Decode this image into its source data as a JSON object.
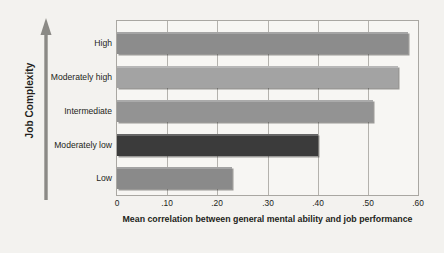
{
  "figure": {
    "background_color": "#f3f2ef",
    "plot_background_color": "#f7f6f3",
    "plot_border_color": "#a9a7a2",
    "gridline_color": "#b4b2ad"
  },
  "axes": {
    "y_title": "Job Complexity",
    "y_arrow_icon": "up-arrow-icon",
    "x_title": "Mean correlation between general mental ability and job performance"
  },
  "chart_data": {
    "type": "bar",
    "orientation": "horizontal",
    "title": "",
    "xlabel": "Mean correlation between general mental ability and job performance",
    "ylabel": "Job Complexity",
    "categories": [
      "High",
      "Moderately high",
      "Intermediate",
      "Moderately low",
      "Low"
    ],
    "values": [
      0.58,
      0.56,
      0.51,
      0.4,
      0.23
    ],
    "bar_colors": [
      "#8c8c8c",
      "#a3a3a3",
      "#939393",
      "#3b3b3b",
      "#8a8a8a"
    ],
    "xlim": [
      0,
      0.6
    ],
    "xticks": [
      0,
      0.1,
      0.2,
      0.3,
      0.4,
      0.5,
      0.6
    ],
    "xtick_labels": [
      "0",
      ".10",
      ".20",
      ".30",
      ".40",
      ".50",
      ".60"
    ],
    "grid": true,
    "grid_axis": "x",
    "legend": false
  }
}
